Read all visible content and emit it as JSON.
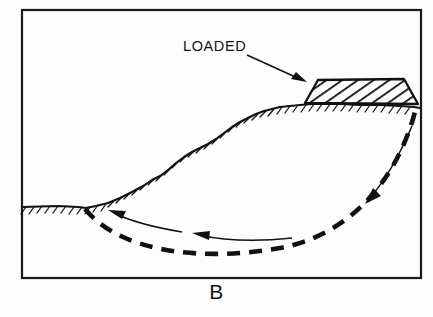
{
  "figure": {
    "caption": "B",
    "callout_label": "LOADED",
    "frame": {
      "x": 22,
      "y": 10,
      "width": 399,
      "height": 268,
      "stroke_color": "#1a1a1a",
      "stroke_width": 2.2
    },
    "background_color": "#fdfdfd",
    "ink_color": "#111111"
  },
  "annotations": {
    "leader_arrow": {
      "name": "loaded-leader-arrow",
      "from_x": 248,
      "from_y": 54,
      "to_x": 305,
      "to_y": 80,
      "description": "arrow from LOADED label to surcharge fill block"
    },
    "label_position": {
      "x": 183,
      "y": 50
    }
  },
  "geometry": {
    "ground_surface": {
      "name": "ground-surface-profile",
      "points": "23,207 58,206 78,207 86,208 96,206 108,203 120,198 132,192 143,186 152,180 160,176 168,170 176,163 184,157 192,152 200,148 208,144 216,139 224,133 232,127 240,122 248,118 256,114 264,111 272,109 280,107 290,106 300,105 312,104 324,104 340,104 360,105 380,105 400,106 414,107 420,108",
      "hachure_count": 46,
      "hachure_length": 7
    },
    "surcharge_fill": {
      "name": "surcharge-fill-block",
      "outline": "305,103 318,80 404,79 418,104",
      "hatch_angle_deg": 55,
      "hatch_spacing": 6.5,
      "fill_label": "LOADED"
    },
    "failure_arc": {
      "name": "failure-surface-arc",
      "path": "M 85,209 C 120,252 200,262 280,248 C 350,235 398,180 416,108",
      "style": "dashed",
      "dash_pattern": "13 9",
      "stroke_width": 4.6
    },
    "motion_arrows": [
      {
        "name": "motion-arrow-toe",
        "path": "M 180,231 C 150,226 128,220 112,212",
        "head_at": "start-left",
        "head_x": 112,
        "head_y": 212
      },
      {
        "name": "motion-arrow-base",
        "path": "M 290,238 C 255,241 222,239 196,234",
        "head_at": "left",
        "head_x": 196,
        "head_y": 234
      },
      {
        "name": "motion-arrow-scarp",
        "path": "M 410,128 C 398,155 384,180 366,200",
        "head_at": "down-left",
        "head_x": 366,
        "head_y": 200
      }
    ]
  }
}
